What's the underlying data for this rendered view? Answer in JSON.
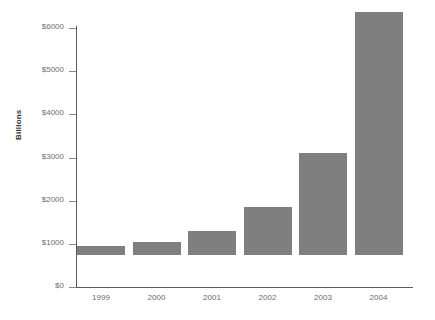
{
  "chart_data": {
    "type": "bar",
    "title": "",
    "subtitle": "",
    "xlabel": "",
    "ylabel": "Billions",
    "categories": [
      "1999",
      "2000",
      "2001",
      "2002",
      "2003",
      "2004"
    ],
    "values": [
      200,
      300,
      560,
      1110,
      2370,
      5640
    ],
    "series": [
      {
        "name": "",
        "values": [
          200,
          300,
          560,
          1110,
          2370,
          5640
        ]
      }
    ],
    "ylim": [
      0,
      6000
    ],
    "ytick_values": [
      0,
      1000,
      2000,
      3000,
      4000,
      5000,
      6000
    ],
    "ytick_labels": [
      "$0",
      "$1000",
      "$2000",
      "$3000",
      "$4000",
      "$5000",
      "$6000"
    ],
    "grid": false,
    "legend": null,
    "legend_position": "none",
    "annotations": [],
    "bar_color": "#7f7f7f",
    "axis_color": "#5a5a5a",
    "tick_label_color": "#6d6d6d",
    "axis_title_color": "#333333",
    "background_color": "#ffffff"
  }
}
